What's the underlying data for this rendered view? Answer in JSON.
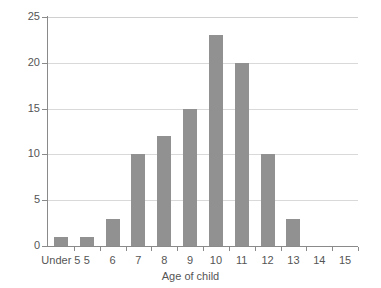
{
  "chart_data": {
    "type": "bar",
    "title": "",
    "xlabel": "Age of child",
    "ylabel": "",
    "categories": [
      "Under 5",
      "5",
      "6",
      "7",
      "8",
      "9",
      "10",
      "11",
      "12",
      "13",
      "14",
      "15"
    ],
    "values": [
      1,
      1,
      3,
      10,
      12,
      15,
      23,
      20,
      10,
      3,
      0,
      0
    ],
    "ylim": [
      0,
      25
    ],
    "yticks": [
      0,
      5,
      10,
      15,
      20,
      25
    ],
    "ytick_labels": [
      "0",
      "5",
      "10",
      "15",
      "20",
      "25"
    ],
    "grid": true,
    "legend": null,
    "bar_color": "#919191",
    "axis_color": "#8a8a8a",
    "grid_color": "#d9d9d9",
    "background": "#ffffff"
  }
}
